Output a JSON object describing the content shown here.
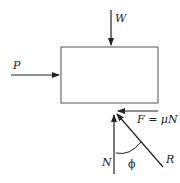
{
  "diagram": {
    "labels": {
      "weight": "W",
      "push": "P",
      "normal": "N",
      "friction": "F = μN",
      "resultant": "R",
      "angle": "ϕ"
    },
    "colors": {
      "stroke": "#222222",
      "background": "#ffffff"
    }
  }
}
